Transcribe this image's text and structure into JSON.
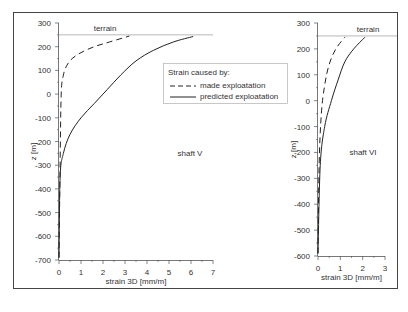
{
  "chart_data": [
    {
      "type": "line",
      "title": "shaft V",
      "xlabel": "strain 3D [mm/m]",
      "ylabel": "z [m]",
      "xlim": [
        0,
        7
      ],
      "ylim": [
        -700,
        300
      ],
      "xticks": [
        0,
        1,
        2,
        3,
        4,
        5,
        6,
        7
      ],
      "yticks": [
        300,
        200,
        100,
        0,
        -100,
        -200,
        -300,
        -400,
        -500,
        -600,
        -700
      ],
      "annotations": [
        "terrain",
        "shaft V"
      ],
      "terrain_z": 250,
      "grid": false,
      "series": [
        {
          "name": "made exploatation",
          "style": "dashed",
          "x": [
            0.0,
            0.05,
            0.1,
            0.2,
            0.35,
            0.6,
            1.0,
            1.6,
            2.3,
            3.2
          ],
          "y": [
            -690,
            -300,
            0,
            80,
            120,
            150,
            175,
            200,
            220,
            245
          ]
        },
        {
          "name": "predicted exploatation",
          "style": "solid",
          "x": [
            0.0,
            0.05,
            0.2,
            0.5,
            1.0,
            1.6,
            2.2,
            2.8,
            3.5,
            4.3,
            5.2,
            6.1
          ],
          "y": [
            -690,
            -350,
            -250,
            -170,
            -100,
            -40,
            20,
            80,
            140,
            185,
            220,
            243
          ]
        }
      ]
    },
    {
      "type": "line",
      "title": "shaft VI",
      "xlabel": "strain 3D [mm/m]",
      "ylabel": "z [m]",
      "xlim": [
        0,
        3
      ],
      "ylim": [
        -600,
        300
      ],
      "xticks": [
        0,
        1,
        2,
        3
      ],
      "yticks": [
        300,
        200,
        100,
        0,
        -100,
        -200,
        -300,
        -400,
        -500,
        -600
      ],
      "annotations": [
        "terrain",
        "shaft VI"
      ],
      "terrain_z": 250,
      "grid": false,
      "series": [
        {
          "name": "made exploatation",
          "style": "dashed",
          "x": [
            0.0,
            0.05,
            0.15,
            0.3,
            0.5,
            0.8,
            1.2
          ],
          "y": [
            -590,
            -250,
            -50,
            60,
            140,
            200,
            245
          ]
        },
        {
          "name": "predicted exploatation",
          "style": "solid",
          "x": [
            0.0,
            0.1,
            0.3,
            0.6,
            0.9,
            1.2,
            1.6,
            2.1
          ],
          "y": [
            -590,
            -250,
            -100,
            0,
            80,
            150,
            200,
            245
          ]
        }
      ]
    }
  ],
  "legend": {
    "title": "Strain caused by:",
    "entries": [
      "made exploatation",
      "predicted exploatation"
    ]
  },
  "panels": {
    "left": {
      "title": "shaft V",
      "terrain_label": "terrain",
      "xlabel": "strain 3D [mm/m]",
      "ylabel": "z [m]"
    },
    "right": {
      "title": "shaft VI",
      "terrain_label": "terrain",
      "xlabel": "strain 3D [mm/m]",
      "ylabel": "z [m]"
    }
  },
  "colors": {
    "line": "#222222",
    "axis": "#555555",
    "frame": "#444444",
    "terrain": "#999999"
  }
}
